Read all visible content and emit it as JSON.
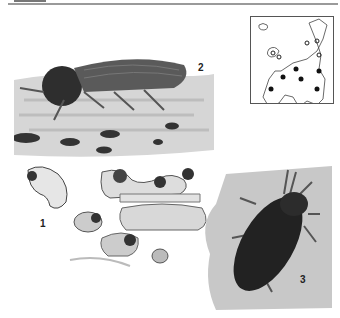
{
  "plate": {
    "figures": [
      {
        "id": "1",
        "label": "1",
        "subject": "larvae and pupae in wood tunnels"
      },
      {
        "id": "2",
        "label": "2",
        "subject": "adult beetle side view on wood"
      },
      {
        "id": "3",
        "label": "3",
        "subject": "adult beetle dorsal view"
      }
    ],
    "map": {
      "subject": "distribution map of Europe",
      "filled_markers": 6,
      "open_markers": 5
    }
  },
  "colors": {
    "ink": "#222222",
    "wood": "#cfcfcf",
    "beetle": "#3a3a3a"
  }
}
